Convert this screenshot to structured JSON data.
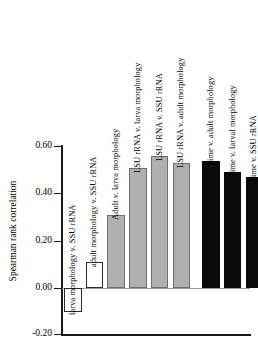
{
  "chart_data": {
    "type": "bar",
    "title": "",
    "xlabel": "",
    "ylabel": "Spearman rank correlation",
    "ylim": [
      -0.2,
      0.6
    ],
    "yticks": [
      "0.60",
      "0.40",
      "0.20",
      "0.00",
      "-0.20"
    ],
    "ytick_values": [
      0.6,
      0.4,
      0.2,
      0.0,
      -0.2
    ],
    "grid": false,
    "legend": "none",
    "zero_line": true,
    "categories": [
      "larva morphology v. SSU rRNA",
      "adult morphology v. SSU rRNA",
      "Adult v. larva morphology",
      "LSU rRNA v. larva morphology",
      "LSU rRNA v. SSU rRNA",
      "LSU rRNA v. adult morphology",
      "Time v. adult morphology",
      "Time v. larval morphology",
      "Time v. SSU rRNA",
      "Time v. LSU rRNA"
    ],
    "values": [
      -0.1,
      0.11,
      0.31,
      0.51,
      0.56,
      0.53,
      0.54,
      0.49,
      0.47,
      0.56
    ],
    "bar_colors": [
      "white",
      "white",
      "gray",
      "gray",
      "gray",
      "gray",
      "black",
      "black",
      "black",
      "black"
    ],
    "color_hex": {
      "white": "#ffffff",
      "gray": "#b0b0b0",
      "black": "#0a0a0a",
      "axis": "#1a1a1a",
      "zero_line": "#9a9a9a"
    }
  }
}
